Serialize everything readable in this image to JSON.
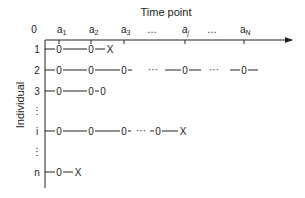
{
  "title": "Time point",
  "y_axis_label": "Individual",
  "time_axis": {
    "origin_label": "0",
    "ticks": [
      {
        "base": "a",
        "sub": "1"
      },
      {
        "base": "a",
        "sub": "2"
      },
      {
        "base": "a",
        "sub": "3"
      },
      {
        "base": "…",
        "sub": ""
      },
      {
        "base": "a",
        "sub": "j"
      },
      {
        "base": "…",
        "sub": ""
      },
      {
        "base": "a",
        "sub": "N"
      }
    ]
  },
  "rows": [
    {
      "label": "1",
      "sequence": "-0-----0--X"
    },
    {
      "label": "2",
      "sequence": "-0-----0-----0- ··· --0-- ··· -0-"
    },
    {
      "label": "3",
      "sequence": "-0-----0-0"
    },
    {
      "label": "⋮",
      "sequence": ""
    },
    {
      "label": "i",
      "sequence": "-0-----0-----0- ··· -0-----X"
    },
    {
      "label": "⋮",
      "sequence": ""
    },
    {
      "label": "n",
      "sequence": "-0--X"
    }
  ],
  "symbols": {
    "observation": "0",
    "dropout": "X",
    "ellipsis": "···"
  }
}
